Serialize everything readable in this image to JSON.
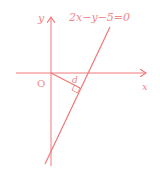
{
  "diagram": {
    "type": "coordinate-geometry",
    "color": "#f07878",
    "axes": {
      "x_label": "x",
      "y_label": "y",
      "origin_label": "O"
    },
    "line": {
      "equation": "2x−y−5=0"
    },
    "distance_label": "d"
  }
}
